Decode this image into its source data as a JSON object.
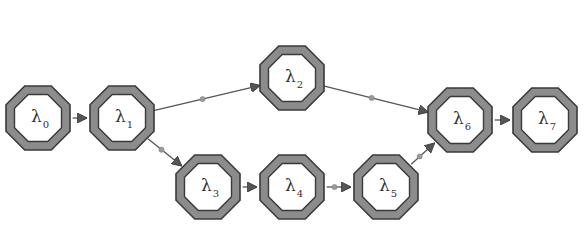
{
  "diagram": {
    "type": "directed-graph",
    "colors": {
      "background": "#ffffff",
      "node_ring": "#8c8c8c",
      "node_outline": "#3a3a3a",
      "node_fill": "#ffffff",
      "edge": "#555555",
      "edge_dot": "#9a9a9a",
      "label": "#333333"
    },
    "nodes": [
      {
        "id": "n0",
        "symbol": "λ",
        "sub": "0",
        "cx": 38,
        "cy": 118
      },
      {
        "id": "n1",
        "symbol": "λ",
        "sub": "1",
        "cx": 122,
        "cy": 118
      },
      {
        "id": "n2",
        "symbol": "λ",
        "sub": "2",
        "cx": 292,
        "cy": 78
      },
      {
        "id": "n3",
        "symbol": "λ",
        "sub": "3",
        "cx": 208,
        "cy": 187
      },
      {
        "id": "n4",
        "symbol": "λ",
        "sub": "4",
        "cx": 292,
        "cy": 187
      },
      {
        "id": "n5",
        "symbol": "λ",
        "sub": "5",
        "cx": 386,
        "cy": 187
      },
      {
        "id": "n6",
        "symbol": "λ",
        "sub": "6",
        "cx": 460,
        "cy": 120
      },
      {
        "id": "n7",
        "symbol": "λ",
        "sub": "7",
        "cx": 545,
        "cy": 120
      }
    ],
    "edges": [
      {
        "from": "n0",
        "to": "n1",
        "dot": false
      },
      {
        "from": "n1",
        "to": "n2",
        "dot": true
      },
      {
        "from": "n1",
        "to": "n3",
        "dot": true
      },
      {
        "from": "n2",
        "to": "n6",
        "dot": true
      },
      {
        "from": "n3",
        "to": "n4",
        "dot": false
      },
      {
        "from": "n4",
        "to": "n5",
        "dot": true
      },
      {
        "from": "n5",
        "to": "n6",
        "dot": true
      },
      {
        "from": "n6",
        "to": "n7",
        "dot": false
      }
    ]
  }
}
